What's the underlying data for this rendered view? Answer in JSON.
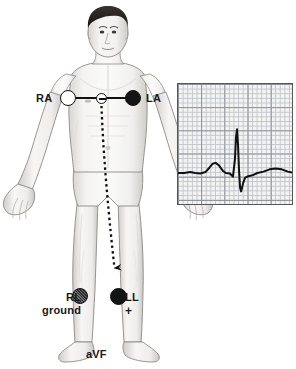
{
  "figure": {
    "type": "medical-illustration",
    "caption": "aVF"
  },
  "electrodes": [
    {
      "id": "RA",
      "label": "RA",
      "sublabel": "",
      "position": "right shoulder / right arm",
      "marker": "open-circle",
      "polarity": ""
    },
    {
      "id": "REF",
      "label": "",
      "sublabel": "",
      "position": "mid-chest reference",
      "marker": "small-open-circle-minus",
      "polarity": "-"
    },
    {
      "id": "LA",
      "label": "LA",
      "sublabel": "",
      "position": "left shoulder / left arm",
      "marker": "filled-circle",
      "polarity": ""
    },
    {
      "id": "RL",
      "label": "RL",
      "sublabel": "ground",
      "position": "right leg",
      "marker": "hatched-circle",
      "polarity": ""
    },
    {
      "id": "LL",
      "label": "LL",
      "sublabel": "+",
      "position": "left leg",
      "marker": "filled-circle",
      "polarity": "+"
    }
  ],
  "labels": {
    "ra": "RA",
    "la": "LA",
    "rl": "RL",
    "rl_ground": "ground",
    "ll": "LL",
    "ll_plus": "+",
    "lead_name": "aVF"
  },
  "vector": {
    "style": "dashed arrow",
    "from": "mid-chest reference electrode",
    "to": "left leg (LL) electrode",
    "direction": "downward (inferior)"
  },
  "colors": {
    "ink": "#141414",
    "grid_minor": "#c3c6cb",
    "grid_major": "#8d9096",
    "grid_background": "#f3f3f3",
    "panel_border": "#55565a",
    "skin": "#f2f1ef",
    "hair": "#2a2623"
  },
  "chart_data": {
    "type": "line",
    "title": "",
    "xlabel": "",
    "ylabel": "",
    "series": [
      {
        "name": "aVF ECG waveform",
        "points": [
          [
            0,
            0
          ],
          [
            6,
            0
          ],
          [
            12,
            0.02
          ],
          [
            17,
            0
          ],
          [
            22,
            -0.01
          ],
          [
            27,
            0.02
          ],
          [
            31,
            0.12
          ],
          [
            34,
            0.2
          ],
          [
            37,
            0.22
          ],
          [
            40,
            0.17
          ],
          [
            44,
            0.05
          ],
          [
            47,
            0.0
          ],
          [
            51,
            -0.01
          ],
          [
            54,
            -0.08
          ],
          [
            56,
            0.3
          ],
          [
            57,
            0.78
          ],
          [
            58,
            0.95
          ],
          [
            59,
            0.6
          ],
          [
            60,
            0.05
          ],
          [
            61,
            -0.32
          ],
          [
            62,
            -0.4
          ],
          [
            64,
            -0.22
          ],
          [
            66,
            -0.1
          ],
          [
            69,
            -0.07
          ],
          [
            73,
            -0.05
          ],
          [
            78,
            0.0
          ],
          [
            84,
            0.03
          ],
          [
            90,
            0.08
          ],
          [
            96,
            0.1
          ],
          [
            102,
            0.08
          ],
          [
            108,
            0.03
          ],
          [
            114,
            0.0
          ]
        ],
        "features": [
          "P wave",
          "QRS complex",
          "S wave",
          "T wave"
        ]
      }
    ],
    "grid": true,
    "grid_minor_cells": 25,
    "grid_major_every": 5,
    "legend": "none"
  }
}
